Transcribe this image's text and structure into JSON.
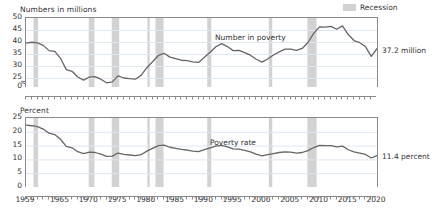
{
  "legend": {
    "label": "Recession",
    "swatch_color": "#d2d2d2",
    "position": "top-right"
  },
  "series_color": "#666666",
  "panels": {
    "top": {
      "axis_title": "Numbers in millions",
      "series_label": "Number in poverty",
      "end_label": "37.2 million"
    },
    "bottom": {
      "axis_title": "Percent",
      "series_label": "Poverty rate",
      "end_label": "11.4 percent"
    }
  },
  "chart_data": [
    {
      "type": "line",
      "title": "Numbers in millions",
      "xlabel": "",
      "ylabel": "Numbers in millions",
      "ylim": [
        0,
        50
      ],
      "yticks": [
        0,
        25,
        30,
        35,
        40,
        45,
        50
      ],
      "y_axis_break": true,
      "y_break_between": [
        0,
        25
      ],
      "xlim": [
        1959,
        2020
      ],
      "xticks": [
        1959,
        1965,
        1970,
        1975,
        1980,
        1985,
        1990,
        1995,
        2000,
        2005,
        2010,
        2015,
        2020
      ],
      "grid": "horizontal",
      "legend": "Recession",
      "annotations": [
        {
          "text": "Number in poverty",
          "x": 1996,
          "y": 43
        },
        {
          "text": "37.2 million",
          "x": 2020,
          "y": 37.2
        }
      ],
      "series": [
        {
          "name": "Number in poverty (millions)",
          "x": [
            1959,
            1960,
            1961,
            1962,
            1963,
            1964,
            1965,
            1966,
            1967,
            1968,
            1969,
            1970,
            1971,
            1972,
            1973,
            1974,
            1975,
            1976,
            1977,
            1978,
            1979,
            1980,
            1981,
            1982,
            1983,
            1984,
            1985,
            1986,
            1987,
            1988,
            1989,
            1990,
            1991,
            1992,
            1993,
            1994,
            1995,
            1996,
            1997,
            1998,
            1999,
            2000,
            2001,
            2002,
            2003,
            2004,
            2005,
            2006,
            2007,
            2008,
            2009,
            2010,
            2011,
            2012,
            2013,
            2014,
            2015,
            2016,
            2017,
            2018,
            2019,
            2020
          ],
          "values": [
            39.5,
            39.9,
            39.6,
            38.6,
            36.4,
            36.1,
            33.2,
            28.5,
            27.8,
            25.4,
            24.1,
            25.4,
            25.6,
            24.5,
            23.0,
            23.4,
            25.9,
            25.0,
            24.7,
            24.5,
            26.1,
            29.3,
            31.8,
            34.4,
            35.3,
            33.7,
            33.1,
            32.4,
            32.2,
            31.7,
            31.5,
            33.6,
            35.7,
            38.0,
            39.3,
            38.1,
            36.4,
            36.5,
            35.6,
            34.5,
            32.8,
            31.6,
            32.9,
            34.6,
            35.9,
            37.0,
            37.0,
            36.5,
            37.3,
            39.8,
            43.6,
            46.3,
            46.2,
            46.5,
            45.3,
            46.7,
            43.1,
            40.6,
            39.7,
            38.1,
            34.0,
            37.2
          ]
        }
      ],
      "recession_bands": [
        [
          1960.3,
          1961.1
        ],
        [
          1969.9,
          1970.9
        ],
        [
          1973.9,
          1975.2
        ],
        [
          1980.1,
          1980.5
        ],
        [
          1981.5,
          1982.9
        ],
        [
          1990.5,
          1991.2
        ],
        [
          2001.2,
          2001.8
        ],
        [
          2007.9,
          2009.5
        ],
        [
          2020.1,
          2020.4
        ]
      ]
    },
    {
      "type": "line",
      "title": "Percent",
      "xlabel": "",
      "ylabel": "Percent",
      "ylim": [
        0,
        25
      ],
      "yticks": [
        0,
        5,
        10,
        15,
        20,
        25
      ],
      "y_axis_break": false,
      "xlim": [
        1959,
        2020
      ],
      "xticks": [
        1959,
        1965,
        1970,
        1975,
        1980,
        1985,
        1990,
        1995,
        2000,
        2005,
        2010,
        2015,
        2020
      ],
      "grid": "horizontal",
      "legend": "Recession",
      "annotations": [
        {
          "text": "Poverty rate",
          "x": 1996,
          "y": 17.5
        },
        {
          "text": "11.4 percent",
          "x": 2020,
          "y": 11.4
        }
      ],
      "series": [
        {
          "name": "Poverty rate (percent)",
          "x": [
            1959,
            1960,
            1961,
            1962,
            1963,
            1964,
            1965,
            1966,
            1967,
            1968,
            1969,
            1970,
            1971,
            1972,
            1973,
            1974,
            1975,
            1976,
            1977,
            1978,
            1979,
            1980,
            1981,
            1982,
            1983,
            1984,
            1985,
            1986,
            1987,
            1988,
            1989,
            1990,
            1991,
            1992,
            1993,
            1994,
            1995,
            1996,
            1997,
            1998,
            1999,
            2000,
            2001,
            2002,
            2003,
            2004,
            2005,
            2006,
            2007,
            2008,
            2009,
            2010,
            2011,
            2012,
            2013,
            2014,
            2015,
            2016,
            2017,
            2018,
            2019,
            2020
          ],
          "values": [
            22.4,
            22.2,
            21.9,
            21.0,
            19.5,
            19.0,
            17.3,
            14.7,
            14.2,
            12.8,
            12.1,
            12.6,
            12.5,
            11.9,
            11.1,
            11.2,
            12.3,
            11.8,
            11.6,
            11.4,
            11.7,
            13.0,
            14.0,
            15.0,
            15.2,
            14.4,
            14.0,
            13.6,
            13.4,
            13.0,
            12.8,
            13.5,
            14.2,
            14.8,
            15.1,
            14.5,
            13.8,
            13.7,
            13.3,
            12.7,
            11.9,
            11.3,
            11.7,
            12.1,
            12.5,
            12.7,
            12.6,
            12.3,
            12.5,
            13.2,
            14.3,
            15.1,
            15.0,
            15.0,
            14.5,
            14.8,
            13.5,
            12.7,
            12.3,
            11.8,
            10.5,
            11.4
          ]
        }
      ],
      "recession_bands": [
        [
          1960.3,
          1961.1
        ],
        [
          1969.9,
          1970.9
        ],
        [
          1973.9,
          1975.2
        ],
        [
          1980.1,
          1980.5
        ],
        [
          1981.5,
          1982.9
        ],
        [
          1990.5,
          1991.2
        ],
        [
          2001.2,
          2001.8
        ],
        [
          2007.9,
          2009.5
        ],
        [
          2020.1,
          2020.4
        ]
      ]
    }
  ]
}
